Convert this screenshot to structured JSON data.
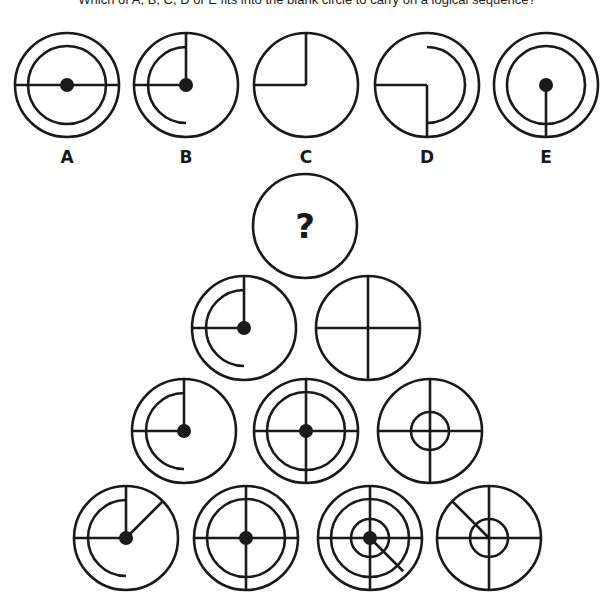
{
  "question": "Which of A, B, C, D or E fits into the blank circle to carry on a logical sequence?",
  "style": {
    "stroke": "#1a1a1a",
    "stroke_width": 2.6,
    "background": "#ffffff"
  },
  "options": [
    {
      "label": "A",
      "cx": 67,
      "cy": 85,
      "r": 52,
      "label_y": 163,
      "parts": {
        "rings": [
          39
        ],
        "hline": "full",
        "dot": true
      }
    },
    {
      "label": "B",
      "cx": 186,
      "cy": 85,
      "r": 52,
      "label_y": 163,
      "parts": {
        "up": true,
        "left": true,
        "arc_left": 38,
        "dot": true
      }
    },
    {
      "label": "C",
      "cx": 306,
      "cy": 85,
      "r": 52,
      "label_y": 163,
      "parts": {
        "up": true,
        "left": true
      }
    },
    {
      "label": "D",
      "cx": 427,
      "cy": 85,
      "r": 52,
      "label_y": 163,
      "parts": {
        "down": true,
        "left": true,
        "arc_right": 38
      }
    },
    {
      "label": "E",
      "cx": 546,
      "cy": 85,
      "r": 52,
      "label_y": 163,
      "parts": {
        "rings": [
          39
        ],
        "down": true,
        "dot": true
      }
    }
  ],
  "pyramid": [
    {
      "id": "blank",
      "cx": 305,
      "cy": 226,
      "r": 52,
      "parts": {
        "question_mark": "?"
      }
    },
    {
      "id": "r2c1",
      "cx": 244,
      "cy": 328,
      "r": 52,
      "parts": {
        "up": true,
        "left": true,
        "arc_left": 38,
        "dot": true
      }
    },
    {
      "id": "r2c2",
      "cx": 368,
      "cy": 328,
      "r": 52,
      "parts": {
        "cross": true
      }
    },
    {
      "id": "r3c1",
      "cx": 184,
      "cy": 431,
      "r": 52,
      "parts": {
        "up": true,
        "left": true,
        "arc_left": 38,
        "dot": true
      }
    },
    {
      "id": "r3c2",
      "cx": 306,
      "cy": 431,
      "r": 52,
      "parts": {
        "rings": [
          39
        ],
        "cross": true,
        "dot": true
      }
    },
    {
      "id": "r3c3",
      "cx": 430,
      "cy": 431,
      "r": 52,
      "parts": {
        "rings": [
          19
        ],
        "cross": true
      }
    },
    {
      "id": "r4c1",
      "cx": 126,
      "cy": 538,
      "r": 52,
      "parts": {
        "up": true,
        "left": true,
        "arc_left": 38,
        "diag": {
          "angle": -45,
          "len": 52
        },
        "dot": true
      }
    },
    {
      "id": "r4c2",
      "cx": 246,
      "cy": 538,
      "r": 52,
      "parts": {
        "rings": [
          39
        ],
        "cross": true,
        "dot": true
      }
    },
    {
      "id": "r4c3",
      "cx": 370,
      "cy": 538,
      "r": 52,
      "parts": {
        "rings": [
          39,
          19
        ],
        "cross": true,
        "diag": {
          "angle": 45,
          "len": 47
        },
        "dot": true
      }
    },
    {
      "id": "r4c4",
      "cx": 489,
      "cy": 538,
      "r": 52,
      "parts": {
        "rings": [
          19
        ],
        "cross": true,
        "diag": {
          "angle": -135,
          "len": 52
        }
      }
    }
  ]
}
